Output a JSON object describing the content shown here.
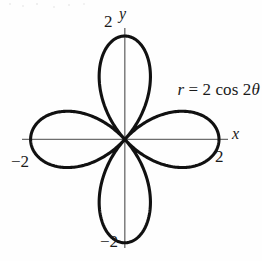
{
  "figure": {
    "kind": "polar-rose-plot",
    "background_color": "#fefefe",
    "curve_color": "#111111",
    "axis_color": "#6e6e6e",
    "equation": {
      "lhs": "r",
      "relation": " = 2 cos 2",
      "theta": "θ",
      "full_text": "r = 2 cos 2θ"
    },
    "axis_labels": {
      "x": "x",
      "y": "y"
    },
    "tick_labels": {
      "y_top": "2",
      "y_bottom": "−2",
      "x_right": "2",
      "x_left": "−2"
    }
  },
  "chart_data": {
    "type": "line",
    "title": "",
    "subtitle": "",
    "xlabel": "x",
    "ylabel": "y",
    "annotations": [
      "r = 2 cos 2θ"
    ],
    "legend": [],
    "legend_position": "none",
    "grid": false,
    "coordinate_system": "polar",
    "xlim": [
      -2.35,
      2.35
    ],
    "ylim": [
      -2.35,
      2.35
    ],
    "xticks": [
      -2,
      2
    ],
    "yticks": [
      -2,
      2
    ],
    "xtick_labels": [
      "−2",
      "2"
    ],
    "ytick_labels": [
      "−2",
      "2"
    ],
    "equation": "r = 2 cos 2θ",
    "amplitude": 2,
    "petal_count": 4,
    "petal_tip_angles_deg": [
      0,
      90,
      180,
      270
    ],
    "petal_tip_radius": 2,
    "series": [
      {
        "name": "r = 2 cos 2θ",
        "theta_deg": [
          0,
          10,
          20,
          30,
          40,
          45,
          50,
          60,
          70,
          80,
          90,
          100,
          110,
          120,
          130,
          135,
          140,
          150,
          160,
          170,
          180,
          190,
          200,
          210,
          220,
          225,
          230,
          240,
          250,
          260,
          270,
          280,
          290,
          300,
          310,
          315,
          320,
          330,
          340,
          350,
          360
        ],
        "r": [
          2,
          1.879,
          1.532,
          1,
          0.347,
          0,
          -0.347,
          -1,
          -1.532,
          -1.879,
          -2,
          -1.879,
          -1.532,
          -1,
          -0.347,
          0,
          0.347,
          1,
          1.532,
          1.879,
          2,
          1.879,
          1.532,
          1,
          0.347,
          0,
          -0.347,
          -1,
          -1.532,
          -1.879,
          -2,
          -1.879,
          -1.532,
          -1,
          -0.347,
          0,
          0.347,
          1,
          1.532,
          1.879,
          2
        ]
      }
    ]
  }
}
